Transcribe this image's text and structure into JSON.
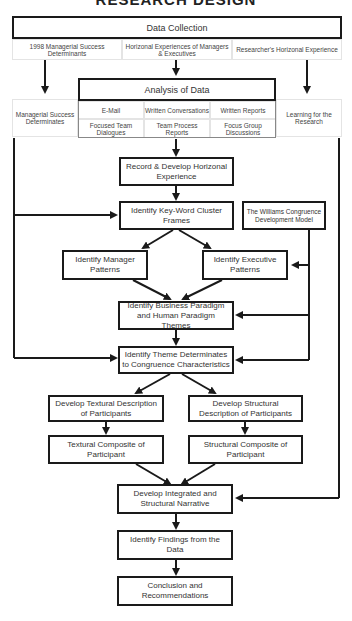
{
  "title": "RESEARCH DESIGN",
  "data_collection": {
    "header": "Data Collection",
    "sources": [
      "1998 Managerial Success Determinants",
      "Horizonal Experiences of Managers & Executives",
      "Researcher's Horizonal Experience"
    ]
  },
  "side_left": "Managerial Success Determinates",
  "side_right": "Learning for the Research",
  "analysis": {
    "header": "Analysis of Data",
    "methods": [
      "E-Mail",
      "Written Conversations",
      "Written Reports",
      "Focused Team Dialogues",
      "Team Process Reports",
      "Focus Group Discussions"
    ]
  },
  "steps": {
    "record": "Record & Develop Horizonal Experience",
    "keyword": "Identify Key-Word Cluster Frames",
    "model": "The Williams Congruence Development Model",
    "manager": "Identify Manager Patterns",
    "executive": "Identify Executive Patterns",
    "paradigm": "Identify Business Paradigm and Human Paradigm Themes",
    "theme": "Identify Theme Determinates to Congruence Characteristics",
    "textual_desc": "Develop Textural Description of Participants",
    "structural_desc": "Develop Structural Description of Participants",
    "textual_comp": "Textural Composite of Participant",
    "structural_comp": "Structural Composite of Participant",
    "narrative": "Develop Integrated and Structural Narrative",
    "findings": "Identify Findings from the Data",
    "conclusion": "Conclusion and Recommendations"
  },
  "colors": {
    "line": "#1a1a1a",
    "text": "#333333",
    "cell_border": "#e4e4e4"
  }
}
